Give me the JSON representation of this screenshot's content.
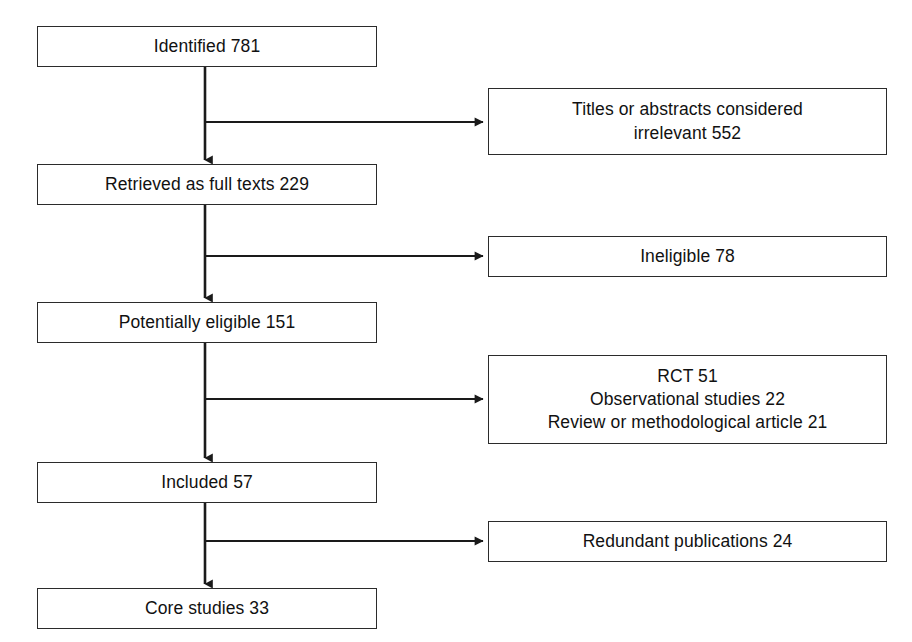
{
  "diagram": {
    "type": "flowchart",
    "title_visible": false,
    "colors": {
      "background": "#ffffff",
      "box_fill": "#ffffff",
      "box_border": "#2b2b2b",
      "connector": "#1a1a1a",
      "text": "#111111"
    },
    "main_flow": [
      {
        "id": "identified",
        "label": "Identified 781",
        "count": 781,
        "x": 37,
        "y": 26,
        "w": 340,
        "h": 41
      },
      {
        "id": "retrieved",
        "label": "Retrieved as full texts 229",
        "count": 229,
        "x": 37,
        "y": 164,
        "w": 340,
        "h": 41
      },
      {
        "id": "potentially",
        "label": "Potentially eligible 151",
        "count": 151,
        "x": 37,
        "y": 302,
        "w": 340,
        "h": 41
      },
      {
        "id": "included",
        "label": "Included 57",
        "count": 57,
        "x": 37,
        "y": 462,
        "w": 340,
        "h": 41
      },
      {
        "id": "core",
        "label": "Core studies 33",
        "count": 33,
        "x": 37,
        "y": 588,
        "w": 340,
        "h": 41
      }
    ],
    "exclusions": [
      {
        "id": "irrelevant",
        "label": "Titles or abstracts considered\nirrelevant 552",
        "count": 552,
        "x": 488,
        "y": 88,
        "w": 399,
        "h": 67,
        "from": "identified",
        "arrow_y": 122
      },
      {
        "id": "ineligible",
        "label": "Ineligible 78",
        "count": 78,
        "x": 488,
        "y": 236,
        "w": 399,
        "h": 41,
        "from": "retrieved",
        "arrow_y": 256
      },
      {
        "id": "excluded",
        "label": "RCT 51\nObservational studies 22\nReview or methodological article 21",
        "count": 94,
        "x": 488,
        "y": 355,
        "w": 399,
        "h": 89,
        "from": "potentially",
        "arrow_y": 399
      },
      {
        "id": "redundant",
        "label": "Redundant publications 24",
        "count": 24,
        "x": 488,
        "y": 521,
        "w": 399,
        "h": 41,
        "from": "included",
        "arrow_y": 541
      }
    ],
    "connectors": {
      "stem_x": 205,
      "branch_end_x": 488,
      "segments": [
        {
          "id": "identified-to-retrieved",
          "x": 205,
          "y1": 67,
          "y2": 164
        },
        {
          "id": "retrieved-to-potentially",
          "x": 205,
          "y1": 205,
          "y2": 302
        },
        {
          "id": "potentially-to-included",
          "x": 205,
          "y1": 343,
          "y2": 462
        },
        {
          "id": "included-to-core",
          "x": 205,
          "y1": 503,
          "y2": 588
        }
      ]
    },
    "counts_summary": {
      "identified": 781,
      "titles_abstracts_irrelevant": 552,
      "retrieved_full_texts": 229,
      "ineligible": 78,
      "potentially_eligible": 151,
      "rct": 51,
      "observational_studies": 22,
      "review_or_methodological_article": 21,
      "included": 57,
      "redundant_publications": 24,
      "core_studies": 33
    }
  }
}
